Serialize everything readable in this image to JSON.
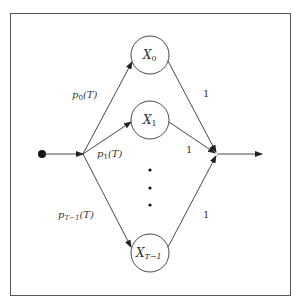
{
  "diagram": {
    "nodes": [
      {
        "id": "X0",
        "label": "X",
        "sub": "0",
        "cx": 150,
        "cy": 55
      },
      {
        "id": "X1",
        "label": "X",
        "sub": "1",
        "cx": 150,
        "cy": 120
      },
      {
        "id": "XT-1",
        "label": "X",
        "sub": "T−1",
        "cx": 150,
        "cy": 253
      }
    ],
    "edge_labels": {
      "p0": {
        "base": "p",
        "sub": "0",
        "arg": "(T)"
      },
      "p1": {
        "base": "p",
        "sub": "1",
        "arg": "(T)"
      },
      "pT1": {
        "base": "p",
        "sub": "T−1",
        "arg": "(T)"
      },
      "w0": "1",
      "w1": "1",
      "wT1": "1"
    },
    "ellipsis": "⋮",
    "colors": {
      "stroke": "#333333",
      "border": "#555555",
      "background": "#ffffff"
    }
  }
}
